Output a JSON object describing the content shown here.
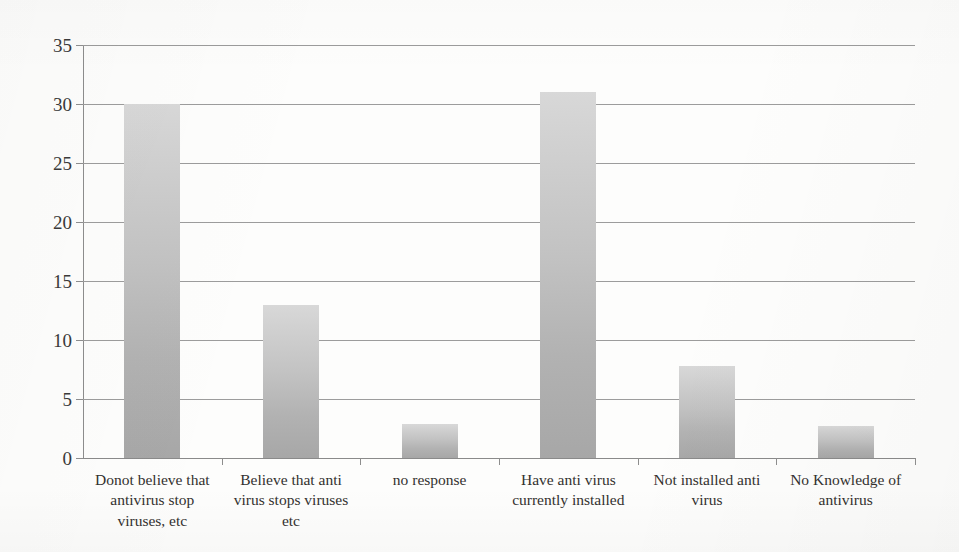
{
  "chart_data": {
    "type": "bar",
    "title": "",
    "subtitle": "",
    "xlabel": "",
    "ylabel": "",
    "categories": [
      "Donot believe that antivirus stop viruses, etc",
      "Believe that anti virus stops viruses etc",
      "no response",
      "Have anti virus currently installed",
      "Not installed anti virus",
      "No Knowledge of antivirus"
    ],
    "category_lines": [
      [
        "Donot believe that",
        "antivirus stop",
        "viruses, etc"
      ],
      [
        "Believe that anti",
        "virus stops viruses",
        "etc"
      ],
      [
        "no response"
      ],
      [
        "Have anti virus",
        "currently installed"
      ],
      [
        "Not installed anti",
        "virus"
      ],
      [
        "No Knowledge of",
        "antivirus"
      ]
    ],
    "values": [
      30,
      13,
      2.9,
      31,
      7.8,
      2.7
    ],
    "ylim": [
      0,
      35
    ],
    "ytick_values": [
      0,
      5,
      10,
      15,
      20,
      25,
      30,
      35
    ],
    "ytick_labels": [
      "0",
      "5",
      "10",
      "15",
      "20",
      "25",
      "30",
      "35"
    ],
    "grid": true,
    "grid_axis": "y",
    "legend": false,
    "legend_position": "none",
    "bar_fill_top_color": "#d8d8d8",
    "bar_fill_bottom_color": "#a7a7a7",
    "gridline_color": "#9c9c9c",
    "axis_color": "#8d8d8d",
    "text_color": "#33312f",
    "background_color": "#fdfdfc"
  }
}
